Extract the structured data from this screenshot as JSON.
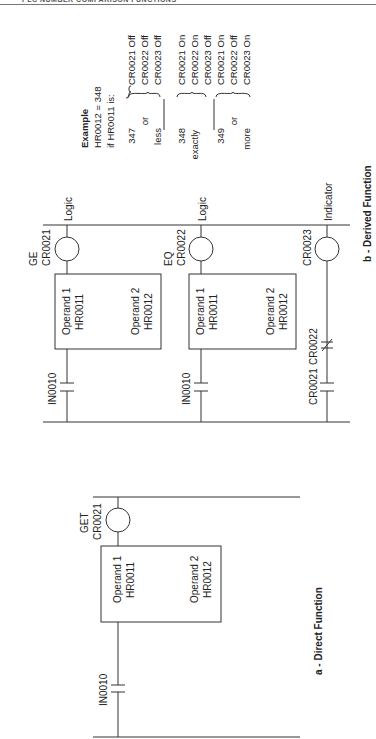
{
  "header": {
    "title": "PLC NUMBER COMPARISON FUNCTIONS"
  },
  "figure_a": {
    "caption": "a - Direct Function",
    "coil": {
      "type": "GET",
      "address": "CR0021"
    },
    "box": {
      "operand1_label": "Operand 1",
      "operand1_value": "HR0011",
      "operand2_label": "Operand 2",
      "operand2_value": "HR0012"
    },
    "contact": {
      "address": "IN0010"
    }
  },
  "figure_b": {
    "caption": "b - Derived Function",
    "rungs": [
      {
        "coil_type": "GE",
        "coil_address": "CR0021",
        "output_label": "Logic",
        "operand1_label": "Operand 1",
        "operand1_value": "HR0011",
        "operand2_label": "Operand 2",
        "operand2_value": "HR0012",
        "contact": "IN0010"
      },
      {
        "coil_type": "EQ",
        "coil_address": "CR0022",
        "output_label": "Logic",
        "operand1_label": "Operand 1",
        "operand1_value": "HR0011",
        "operand2_label": "Operand 2",
        "operand2_value": "HR0012",
        "contact": "IN0010"
      },
      {
        "coil_address": "CR0023",
        "output_label": "Indicator",
        "contact_no": "CR0021",
        "contact_nc": "CR0022"
      }
    ]
  },
  "example": {
    "title": "Example",
    "line1": "HR0012 = 348",
    "line2": "if HR0011 is:",
    "cases": [
      {
        "cond": [
          "347",
          "or",
          "less"
        ],
        "results": [
          "CR0021 Off",
          "CR0022 Off",
          "CR0023 Off"
        ]
      },
      {
        "cond": [
          "348",
          "exactly"
        ],
        "results": [
          "CR0021 On",
          "CR0022 On",
          "CR0023 Off"
        ]
      },
      {
        "cond": [
          "349",
          "or",
          "more"
        ],
        "results": [
          "CR0021 On",
          "CR0022 Off",
          "CR0023 On"
        ]
      }
    ]
  }
}
